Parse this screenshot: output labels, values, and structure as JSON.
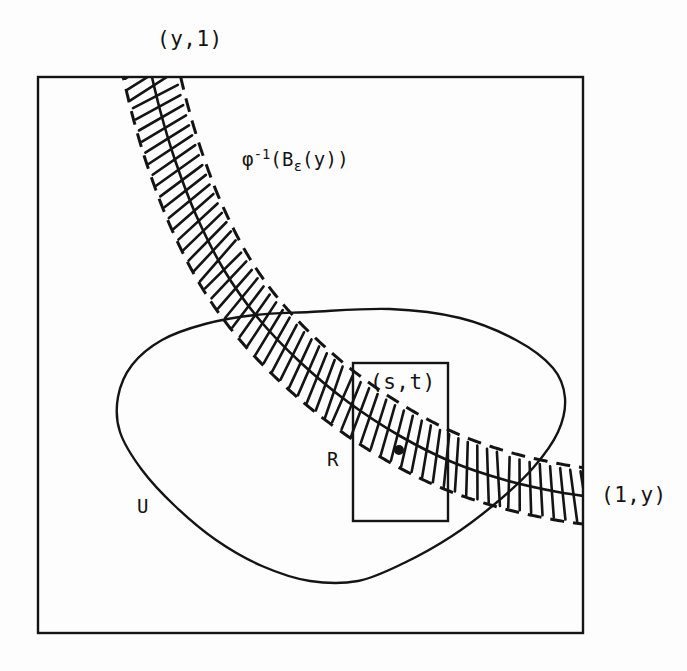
{
  "figure": {
    "background_color": "#fdfdfd",
    "ink_color": "#141414"
  },
  "labels": {
    "corner_top": "(y,1)",
    "corner_right": "(1,y)",
    "band": {
      "base": "φ",
      "superscript": "-1",
      "open_paren": "(B",
      "subscript": "ε",
      "tail": "(y))"
    },
    "point": "(s,t)",
    "rectangle": "R",
    "region": "U"
  },
  "chart_data": {
    "type": "diagram",
    "square_domain": {
      "name": "unit-square-border",
      "x_min": 38,
      "y_min": 77,
      "x_max": 583,
      "y_max": 633,
      "stroke_width": 2.4
    },
    "band": {
      "name": "phi-inverse-band",
      "label": "φ⁻¹(Bε(y))",
      "center_curve": [
        [
          148,
          60
        ],
        [
          160,
          110
        ],
        [
          175,
          160
        ],
        [
          196,
          215
        ],
        [
          224,
          270
        ],
        [
          258,
          318
        ],
        [
          300,
          362
        ],
        [
          348,
          402
        ],
        [
          400,
          436
        ],
        [
          452,
          462
        ],
        [
          505,
          480
        ],
        [
          558,
          492
        ],
        [
          600,
          498
        ]
      ],
      "half_width": 28,
      "hatch_spacing": 11,
      "dash_pattern": "14 9",
      "boundary_style": "dashed",
      "center_style": "solid",
      "hatch_style": "perpendicular-ticks"
    },
    "region_U": {
      "name": "open-set-U",
      "label": "U",
      "outline": [
        [
          310,
          312
        ],
        [
          390,
          309
        ],
        [
          460,
          318
        ],
        [
          516,
          340
        ],
        [
          553,
          368
        ],
        [
          565,
          398
        ],
        [
          558,
          432
        ],
        [
          533,
          468
        ],
        [
          496,
          503
        ],
        [
          452,
          536
        ],
        [
          404,
          563
        ],
        [
          358,
          581
        ],
        [
          310,
          581
        ],
        [
          262,
          566
        ],
        [
          216,
          540
        ],
        [
          175,
          506
        ],
        [
          142,
          470
        ],
        [
          120,
          432
        ],
        [
          118,
          397
        ],
        [
          132,
          365
        ],
        [
          162,
          340
        ],
        [
          205,
          324
        ],
        [
          255,
          315
        ]
      ],
      "stroke_width": 2.4
    },
    "rectangle_R": {
      "name": "rectangle-R",
      "label": "R",
      "x_min": 353,
      "y_min": 363,
      "x_max": 448,
      "y_max": 521,
      "stroke_width": 2.4
    },
    "marked_point": {
      "name": "point-s-t",
      "label": "(s,t)",
      "x": 399,
      "y": 450,
      "radius": 5
    },
    "annotations": [
      {
        "text": "(y,1)",
        "x": 200,
        "y": 40,
        "anchor": "top-of-square"
      },
      {
        "text": "φ⁻¹(Bε(y))",
        "x": 300,
        "y": 160,
        "anchor": "right-of-band"
      },
      {
        "text": "(s,t)",
        "x": 404,
        "y": 383,
        "anchor": "inside-rectangle"
      },
      {
        "text": "R",
        "x": 334,
        "y": 460,
        "anchor": "left-of-rectangle"
      },
      {
        "text": "U",
        "x": 144,
        "y": 507,
        "anchor": "inside-region"
      },
      {
        "text": "(1,y)",
        "x": 630,
        "y": 496,
        "anchor": "right-of-square"
      }
    ]
  }
}
